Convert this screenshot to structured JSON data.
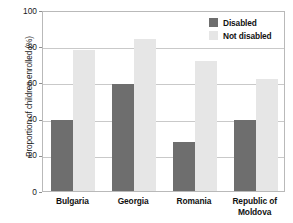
{
  "chart_data": {
    "type": "bar",
    "title": "",
    "xlabel": "",
    "ylabel": "Proportion of children enrolled (%)",
    "categories": [
      "Bulgaria",
      "Georgia",
      "Romania",
      "Republic of Moldova"
    ],
    "category_lines": [
      [
        "Bulgaria"
      ],
      [
        "Georgia"
      ],
      [
        "Romania"
      ],
      [
        "Republic of",
        "Moldova"
      ]
    ],
    "series": [
      {
        "name": "Disabled",
        "color": "#6e6e6e",
        "values": [
          39,
          59,
          27,
          39
        ]
      },
      {
        "name": "Not disabled",
        "color": "#e6e6e6",
        "values": [
          78,
          84,
          72,
          62
        ]
      }
    ],
    "ylim": [
      0,
      100
    ],
    "yticks": [
      0,
      20,
      40,
      60,
      80,
      100
    ],
    "ytick_labels": [
      "0",
      "20",
      "40",
      "60",
      "80",
      "100"
    ],
    "grid": true,
    "legend_position": "top-right",
    "legend_entries": [
      "Disabled",
      "Not disabled"
    ]
  },
  "legend": {
    "items": [
      {
        "label": "Disabled"
      },
      {
        "label": "Not disabled"
      }
    ]
  },
  "axis": {
    "y_title": "Proportion of children enrolled (%)"
  }
}
